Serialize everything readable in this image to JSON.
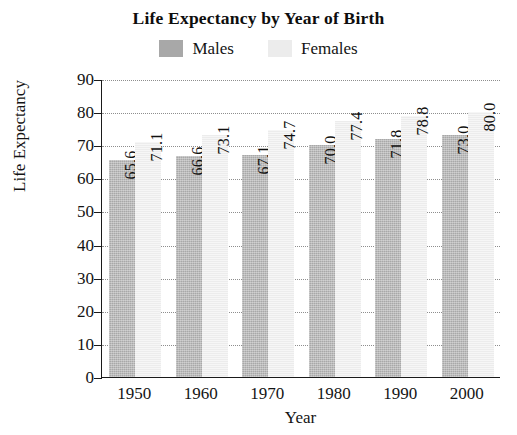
{
  "chart_data": {
    "type": "bar",
    "title": "Life Expectancy by Year of Birth",
    "xlabel": "Year",
    "ylabel": "Life Expectancy",
    "categories": [
      "1950",
      "1960",
      "1970",
      "1980",
      "1990",
      "2000"
    ],
    "series": [
      {
        "name": "Males",
        "color": "#a8a8a8",
        "values": [
          65.6,
          66.6,
          67.1,
          70.0,
          71.8,
          73.0
        ],
        "labels": [
          "65.6",
          "66.6",
          "67.1",
          "70.0",
          "71.8",
          "73.0"
        ]
      },
      {
        "name": "Females",
        "color": "#ececec",
        "values": [
          71.1,
          73.1,
          74.7,
          77.4,
          78.8,
          80.0
        ],
        "labels": [
          "71.1",
          "73.1",
          "74.7",
          "77.4",
          "78.8",
          "80.0"
        ]
      }
    ],
    "ylim": [
      0,
      90
    ],
    "yticks": [
      0,
      10,
      20,
      30,
      40,
      50,
      60,
      70,
      80,
      90
    ],
    "ytick_labels": [
      "0",
      "10",
      "20",
      "30",
      "40",
      "50",
      "60",
      "70",
      "80",
      "90"
    ],
    "grid": true,
    "grid_style": "dotted",
    "legend_position": "top-center",
    "value_labels_rotated": true,
    "background": "#ffffff",
    "axis_color": "#1a1a1a"
  }
}
